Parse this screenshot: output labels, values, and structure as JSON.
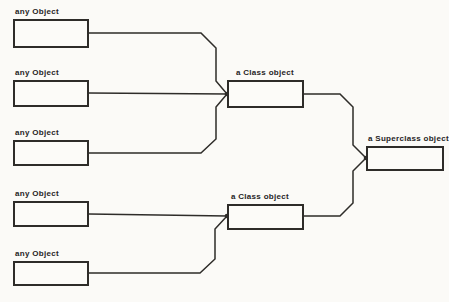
{
  "figure": {
    "background_color": "#fbfaf7",
    "line_color": "#2e2c29",
    "text_color": "#26241f",
    "nodes": {
      "any_objects": [
        {
          "label": "any Object"
        },
        {
          "label": "any Object"
        },
        {
          "label": "any Object"
        },
        {
          "label": "any Object"
        },
        {
          "label": "any Object"
        }
      ],
      "class_objects": [
        {
          "label": "a Class object"
        },
        {
          "label": "a Class object"
        }
      ],
      "superclass_object": {
        "label": "a Superclass object"
      }
    },
    "edges": [
      {
        "from": "any Object 1",
        "to": "a Class object 1"
      },
      {
        "from": "any Object 2",
        "to": "a Class object 1"
      },
      {
        "from": "any Object 3",
        "to": "a Class object 1"
      },
      {
        "from": "any Object 4",
        "to": "a Class object 2"
      },
      {
        "from": "any Object 5",
        "to": "a Class object 2"
      },
      {
        "from": "a Class object 1",
        "to": "a Superclass object"
      },
      {
        "from": "a Class object 2",
        "to": "a Superclass object"
      }
    ]
  }
}
